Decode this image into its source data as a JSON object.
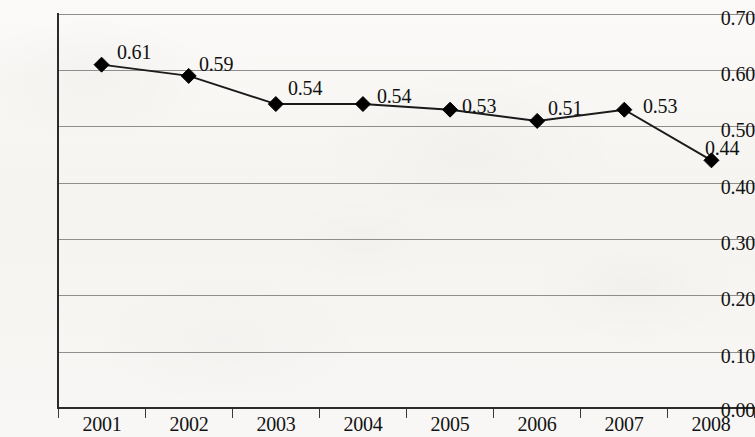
{
  "chart_data": {
    "type": "line",
    "title": "",
    "subtitle": "",
    "xlabel": "",
    "ylabel": "",
    "categories": [
      "2001",
      "2002",
      "2003",
      "2004",
      "2005",
      "2006",
      "2007",
      "2008"
    ],
    "values": [
      0.61,
      0.59,
      0.54,
      0.54,
      0.53,
      0.51,
      0.53,
      0.44
    ],
    "point_labels": [
      "0.61",
      "0.59",
      "0.54",
      "0.54",
      "0.53",
      "0.51",
      "0.53",
      "0.44"
    ],
    "series": [
      {
        "name": "",
        "values": [
          0.61,
          0.59,
          0.54,
          0.54,
          0.53,
          0.51,
          0.53,
          0.44
        ]
      }
    ],
    "ylim": [
      0.0,
      0.7
    ],
    "ytick_values": [
      0.7,
      0.6,
      0.5,
      0.4,
      0.3,
      0.2,
      0.1,
      0.0
    ],
    "ytick_labels": [
      "0.70",
      "0.60",
      "0.50",
      "0.40",
      "0.30",
      "0.20",
      "0.10",
      "0.00"
    ],
    "xtick_labels": [
      "2001",
      "2002",
      "2003",
      "2004",
      "2005",
      "2006",
      "2007",
      "2008"
    ],
    "grid": "horizontal",
    "legend": "none",
    "marker": "diamond",
    "marker_color": "#000000",
    "line_color": "#1a1a1a",
    "grid_color": "#8e8e8e",
    "axis_color": "#2b2b2b",
    "background_color": "#f7f6f4"
  },
  "axis": {
    "y_labels": [
      "0.70",
      "0.60",
      "0.50",
      "0.40",
      "0.30",
      "0.20",
      "0.10",
      "0.00"
    ],
    "x_labels": [
      "2001",
      "2002",
      "2003",
      "2004",
      "2005",
      "2006",
      "2007",
      "2008"
    ]
  },
  "labels": {
    "points": [
      "0.61",
      "0.59",
      "0.54",
      "0.54",
      "0.53",
      "0.51",
      "0.53",
      "0.44"
    ]
  }
}
